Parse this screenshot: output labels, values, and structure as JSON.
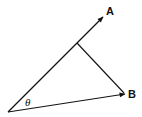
{
  "diagram": {
    "type": "vector-projection",
    "labels": {
      "vector_a": "A",
      "vector_b": "B",
      "angle": "θ"
    },
    "colors": {
      "stroke": "#111111",
      "background": "#ffffff"
    }
  }
}
